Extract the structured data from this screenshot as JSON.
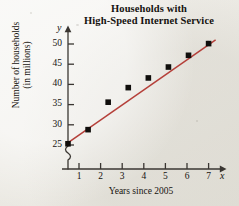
{
  "chart_data": {
    "type": "scatter",
    "title": "Households with High-Speed Internet Service",
    "title_lines": [
      "Households with",
      "High-Speed Internet Service"
    ],
    "xlabel": "Years since 2005",
    "ylabel": "Number of households (in millions)",
    "ylabel_lines": [
      "Number of households",
      "(in millions)"
    ],
    "x_axis_variable": "x",
    "y_axis_variable": "y",
    "x": [
      0,
      1,
      2,
      3,
      4,
      5,
      6,
      7
    ],
    "values": [
      25.3,
      28.8,
      35.6,
      39.2,
      41.6,
      44.3,
      47.2,
      50.1
    ],
    "xlim": [
      0,
      7.6
    ],
    "ylim": [
      25,
      51.5
    ],
    "xticks": [
      1,
      2,
      3,
      4,
      5,
      6,
      7
    ],
    "xtick_labels": [
      "1",
      "2",
      "3",
      "4",
      "5",
      "6",
      "7"
    ],
    "yticks": [
      25,
      30,
      35,
      40,
      45,
      50
    ],
    "ytick_labels": [
      "25",
      "30",
      "35",
      "40",
      "45",
      "50"
    ],
    "grid": false,
    "legend": "none",
    "y_axis_break": true,
    "trend_line": {
      "name": "line of best fit",
      "x_start": 0,
      "y_start": 25.2,
      "x_end": 7.35,
      "y_end": 51.0,
      "slope": 3.51,
      "intercept": 25.2,
      "color": "#b5403a"
    },
    "marker": {
      "shape": "square",
      "color": "#100e0c",
      "size_px": 5
    },
    "colors": {
      "axis": "#3a3632",
      "text": "#16130f",
      "trend": "#b5403a",
      "background": "#efeee9"
    }
  }
}
